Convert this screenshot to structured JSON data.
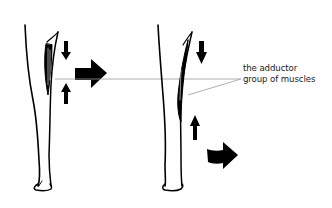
{
  "diagram": {
    "label": {
      "line1": "the adductor",
      "line2": "group of muscles"
    },
    "colors": {
      "ink": "#000000",
      "pointer_line": "#9a9a9a",
      "background": "#ffffff"
    },
    "figures": [
      {
        "name": "leg-left",
        "muscle": "contracted",
        "force_arrows": [
          "down",
          "up"
        ],
        "movement_arrow": "right-upper"
      },
      {
        "name": "leg-right",
        "muscle": "stretched",
        "force_arrows": [
          "down",
          "up"
        ],
        "movement_arrow": "right-lower"
      }
    ]
  }
}
